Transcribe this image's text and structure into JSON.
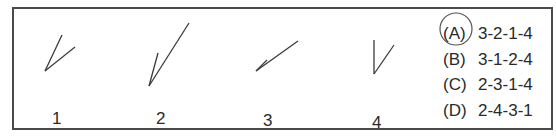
{
  "figures": [
    {
      "label": "1",
      "vertex": [
        45,
        71
      ],
      "arm_a": [
        62,
        35
      ],
      "arm_b": [
        75,
        47
      ]
    },
    {
      "label": "2",
      "vertex": [
        149,
        86
      ],
      "arm_a": [
        189,
        23
      ],
      "arm_b": [
        158,
        53
      ]
    },
    {
      "label": "3",
      "vertex": [
        256,
        71
      ],
      "arm_a": [
        298,
        41
      ],
      "arm_b": [
        267,
        60
      ]
    },
    {
      "label": "4",
      "vertex": [
        374,
        74
      ],
      "arm_a": [
        374,
        40
      ],
      "arm_b": [
        394,
        45
      ]
    }
  ],
  "options": [
    {
      "letter": "(A)",
      "sequence": "3-2-1-4",
      "circled": true
    },
    {
      "letter": "(B)",
      "sequence": "3-1-2-4",
      "circled": false
    },
    {
      "letter": "(C)",
      "sequence": "2-3-1-4",
      "circled": false
    },
    {
      "letter": "(D)",
      "sequence": "2-4-3-1",
      "circled": false
    }
  ],
  "colors": {
    "ink": "#2a2a2a",
    "border": "#4a4a4a",
    "circle": "#555555"
  }
}
